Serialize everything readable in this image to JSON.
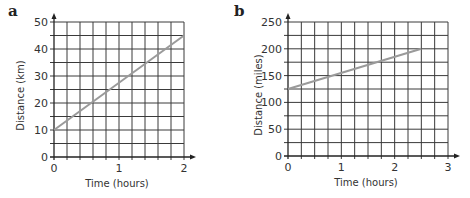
{
  "chart_data": [
    {
      "panel": "a",
      "type": "line",
      "title": "",
      "xlabel": "Time (hours)",
      "ylabel": "Distance (km)",
      "xlim": [
        0,
        2
      ],
      "ylim": [
        0,
        50
      ],
      "x_ticks": [
        0,
        1,
        2
      ],
      "y_ticks": [
        0,
        10,
        20,
        30,
        40,
        50
      ],
      "grid": true,
      "grid_x_step": 0.2,
      "grid_y_step": 5,
      "series": [
        {
          "name": "distance",
          "x": [
            0,
            2
          ],
          "y": [
            10,
            45
          ]
        }
      ]
    },
    {
      "panel": "b",
      "type": "line",
      "title": "",
      "xlabel": "Time (hours)",
      "ylabel": "Distance (miles)",
      "xlim": [
        0,
        3
      ],
      "ylim": [
        0,
        250
      ],
      "x_ticks": [
        0,
        1,
        2,
        3
      ],
      "y_ticks": [
        0,
        50,
        100,
        150,
        200,
        250
      ],
      "grid": true,
      "grid_x_step": 0.25,
      "grid_y_step": 25,
      "series": [
        {
          "name": "distance",
          "x": [
            0,
            2.5
          ],
          "y": [
            125,
            200
          ]
        }
      ]
    }
  ],
  "panels": {
    "a": {
      "letter": "a"
    },
    "b": {
      "letter": "b"
    }
  },
  "colors": {
    "grid": "#3a3a3a",
    "line": "#9a9a9a",
    "text": "#333333"
  }
}
